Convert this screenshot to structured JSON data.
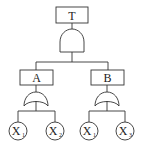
{
  "diagram": {
    "type": "fault-tree",
    "top_event": {
      "label": "T",
      "gate": "AND"
    },
    "intermediate_events": [
      {
        "label": "A",
        "gate": "OR",
        "inputs": [
          "X1",
          "X2"
        ]
      },
      {
        "label": "B",
        "gate": "OR",
        "inputs": [
          "X1",
          "X3"
        ]
      }
    ],
    "basic_events": [
      {
        "base": "X",
        "sub": "1"
      },
      {
        "base": "X",
        "sub": "2"
      },
      {
        "base": "X",
        "sub": "1"
      },
      {
        "base": "X",
        "sub": "3"
      }
    ],
    "colors": {
      "line": "#333333",
      "text": "#222222",
      "background": "#ffffff"
    }
  }
}
